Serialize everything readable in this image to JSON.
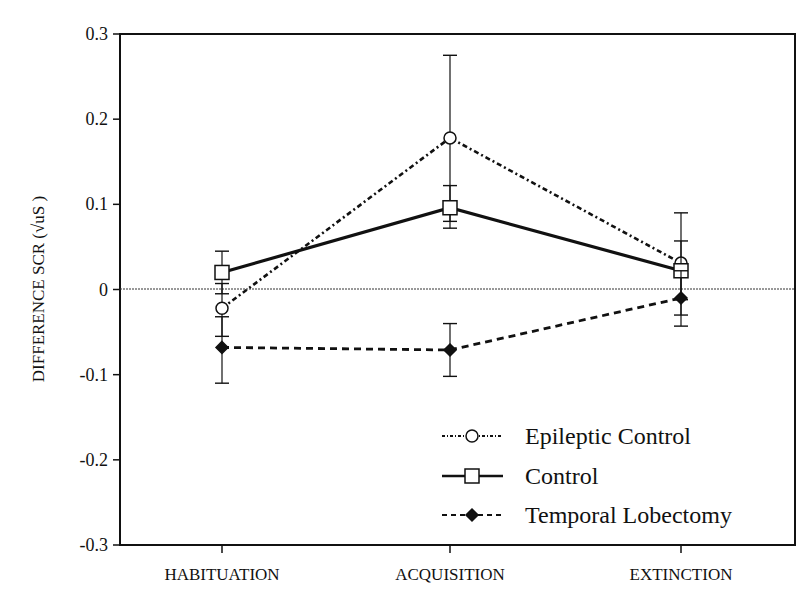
{
  "chart_data": {
    "type": "line",
    "title": "",
    "xlabel": "",
    "ylabel": "DIFFERENCE SCR",
    "ylabel_unit": "√uS",
    "categories": [
      "HABITUATION",
      "ACQUISITION",
      "EXTINCTION"
    ],
    "ylim": [
      -0.3,
      0.3
    ],
    "yticks": [
      0.3,
      0.2,
      0.1,
      0,
      -0.1,
      -0.2,
      -0.3
    ],
    "ytick_labels": [
      "0.3",
      "0.2",
      "0.1",
      "0",
      "-0.1",
      "-0.2",
      "-0.3"
    ],
    "grid": false,
    "zero_line": true,
    "legend_position": "lower right",
    "series": [
      {
        "name": "Epileptic Control",
        "marker": "open-circle",
        "line": "dash-dot",
        "values": [
          -0.022,
          0.178,
          0.031
        ],
        "error_upper": [
          0.007,
          0.275,
          0.09
        ],
        "error_lower": [
          -0.055,
          0.08,
          -0.03
        ]
      },
      {
        "name": "Control",
        "marker": "open-square",
        "line": "solid",
        "values": [
          0.02,
          0.096,
          0.022
        ],
        "error_upper": [
          0.045,
          0.122,
          0.057
        ],
        "error_lower": [
          -0.005,
          0.072,
          -0.012
        ]
      },
      {
        "name": "Temporal Lobectomy",
        "marker": "filled-diamond",
        "line": "dashed",
        "values": [
          -0.068,
          -0.071,
          -0.01
        ],
        "error_upper": [
          -0.032,
          -0.04,
          0.022
        ],
        "error_lower": [
          -0.11,
          -0.102,
          -0.043
        ]
      }
    ]
  },
  "legend": {
    "items": [
      {
        "label": "Epileptic Control"
      },
      {
        "label": "Control"
      },
      {
        "label": "Temporal Lobectomy"
      }
    ]
  }
}
